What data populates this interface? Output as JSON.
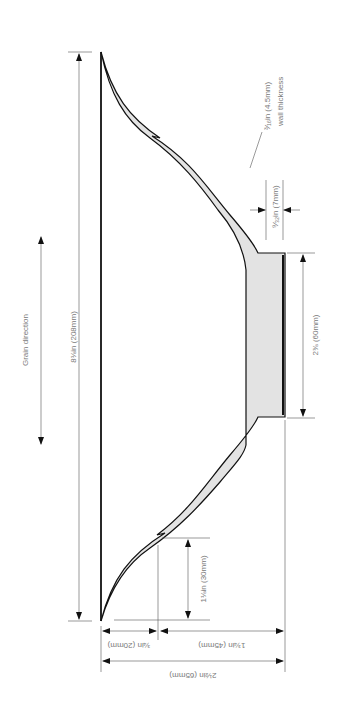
{
  "diagram": {
    "colors": {
      "outline": "#111111",
      "wall_fill": "#e3e3e3",
      "dimension_line": "#555555",
      "label_text": "#7a7a7a",
      "background": "#ffffff"
    },
    "labels": {
      "grain_direction": "Grain direction",
      "overall_diameter": "8⅛in (208mm)",
      "wall_thickness_value": "³⁄₁₆in (4.5mm)",
      "wall_thickness_caption": "wall thickness",
      "base_thickness": "⁹⁄₃₂in (7mm)",
      "foot_diameter": "2⅜ (60mm)",
      "notch_height": "1⅛in (30mm)",
      "rim_to_foot_left": "¾in (20mm)",
      "foot_depth": "1¾in (45mm)",
      "total_height": "2½in (65mm)"
    }
  }
}
